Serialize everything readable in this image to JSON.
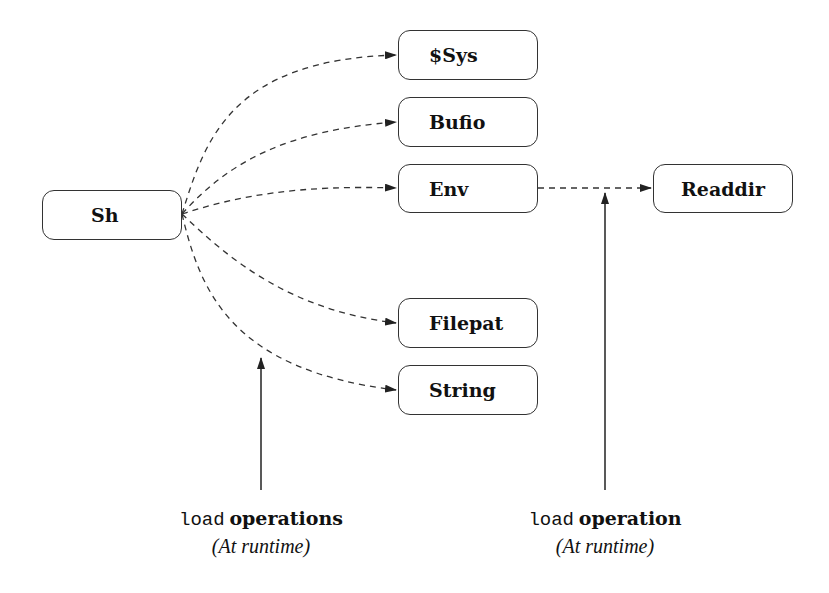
{
  "diagram": {
    "source_node": {
      "label": "Sh"
    },
    "target_nodes": [
      {
        "label": "$Sys"
      },
      {
        "label": "Bufio"
      },
      {
        "label": "Env"
      },
      {
        "label": "Filepat"
      },
      {
        "label": "String"
      }
    ],
    "secondary_node": {
      "label": "Readdir"
    },
    "edges": [
      {
        "from": "Sh",
        "to": "$Sys",
        "style": "dashed"
      },
      {
        "from": "Sh",
        "to": "Bufio",
        "style": "dashed"
      },
      {
        "from": "Sh",
        "to": "Env",
        "style": "dashed"
      },
      {
        "from": "Sh",
        "to": "Filepat",
        "style": "dashed"
      },
      {
        "from": "Sh",
        "to": "String",
        "style": "dashed"
      },
      {
        "from": "Env",
        "to": "Readdir",
        "style": "dashed"
      }
    ],
    "annotations": [
      {
        "code": "load",
        "label": "operations",
        "note": "(At runtime)"
      },
      {
        "code": "load",
        "label": "operation",
        "note": "(At runtime)"
      }
    ],
    "colors": {
      "stroke": "#333333",
      "background": "#ffffff",
      "text": "#111111"
    }
  }
}
